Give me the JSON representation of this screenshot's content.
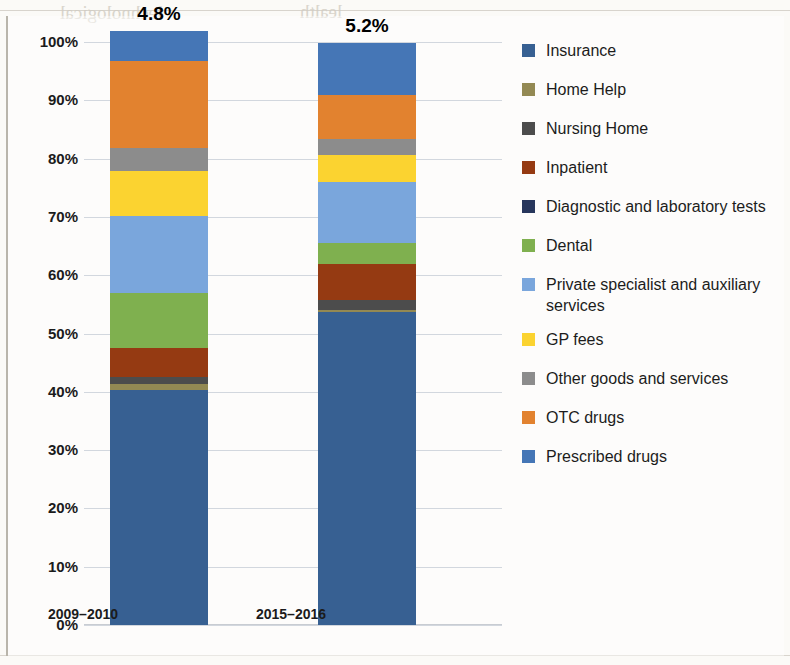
{
  "chart_data": {
    "type": "bar",
    "subtype": "stacked-100-percent",
    "title": "",
    "xlabel": "",
    "ylabel": "",
    "ylim": [
      0,
      100
    ],
    "grid": true,
    "legend_position": "right",
    "categories": [
      "2009–2010",
      "2015–2016"
    ],
    "y_ticks": [
      "0%",
      "10%",
      "20%",
      "30%",
      "40%",
      "50%",
      "60%",
      "70%",
      "80%",
      "90%",
      "100%"
    ],
    "bar_labels": [
      "4.8%",
      "5.2%"
    ],
    "series": [
      {
        "name": "Insurance",
        "color": "#376092",
        "values": [
          40.3,
          53.7
        ]
      },
      {
        "name": "Home Help",
        "color": "#938953",
        "values": [
          1.0,
          0.3
        ]
      },
      {
        "name": "Nursing Home",
        "color": "#4c4c4c",
        "values": [
          1.2,
          1.7
        ]
      },
      {
        "name": "Inpatient",
        "color": "#953a12",
        "values": [
          5.1,
          6.2
        ]
      },
      {
        "name": "Diagnostic and laboratory tests",
        "color": "#27365c",
        "values": [
          0.0,
          0.0
        ]
      },
      {
        "name": "Dental",
        "color": "#7fb04f",
        "values": [
          9.4,
          3.6
        ]
      },
      {
        "name": "Private specialist and auxiliary services",
        "color": "#7aa6dc",
        "values": [
          13.2,
          10.5
        ]
      },
      {
        "name": "GP fees",
        "color": "#fbd330",
        "values": [
          7.7,
          4.6
        ]
      },
      {
        "name": "Other goods and services",
        "color": "#8c8c8c",
        "values": [
          3.9,
          2.7
        ]
      },
      {
        "name": "OTC drugs",
        "color": "#e2822f",
        "values": [
          15.0,
          7.7
        ]
      },
      {
        "name": "Prescribed drugs",
        "color": "#4576b6",
        "values": [
          5.1,
          8.9
        ]
      }
    ]
  },
  "legend": {
    "items": [
      {
        "label": "Insurance",
        "color": "#376092"
      },
      {
        "label": "Home Help",
        "color": "#938953"
      },
      {
        "label": "Nursing Home",
        "color": "#4c4c4c"
      },
      {
        "label": "Inpatient",
        "color": "#953a12"
      },
      {
        "label": "Diagnostic and laboratory tests",
        "color": "#27365c"
      },
      {
        "label": "Dental",
        "color": "#7fb04f"
      },
      {
        "label": "Private specialist and auxiliary services",
        "color": "#7aa6dc"
      },
      {
        "label": "GP fees",
        "color": "#fbd330"
      },
      {
        "label": "Other goods and services",
        "color": "#8c8c8c"
      },
      {
        "label": "OTC drugs",
        "color": "#e2822f"
      },
      {
        "label": "Prescribed drugs",
        "color": "#4576b6"
      }
    ]
  },
  "background_page_text": [
    "lechnological",
    "lealth",
    "expenditure"
  ]
}
